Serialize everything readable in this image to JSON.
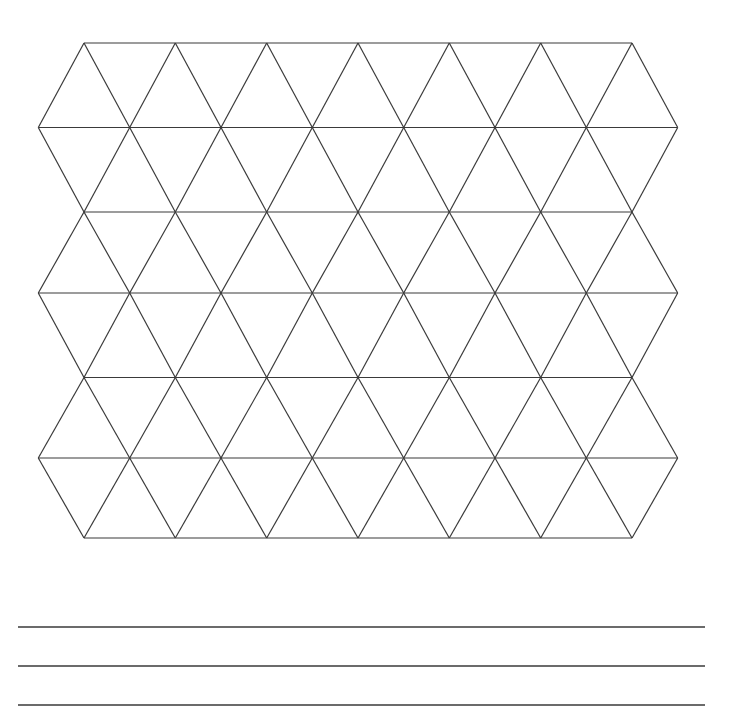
{
  "page": {
    "width": 734,
    "height": 709,
    "background_color": "#ffffff"
  },
  "figure": {
    "name": "triangular-tessellation-grid",
    "stroke_color": "#3a3a3a",
    "stroke_width": 1.2,
    "fill": "none",
    "rows_of_triangles": 6,
    "triangle_columns": 7,
    "total_triangles": 90,
    "bounds": {
      "left": 38,
      "top": 43,
      "right": 678,
      "bottom": 538
    }
  },
  "chart_data": {
    "type": "diagram",
    "title": "",
    "subtitle": "",
    "xlabel": "",
    "ylabel": "",
    "grid": true,
    "legend": "none",
    "lattice": {
      "kind": "triangular",
      "apex_x": [
        84,
        175.3,
        266.7,
        358,
        449.3,
        540.7,
        632
      ],
      "mid_x": [
        38.3,
        129.7,
        221,
        312.3,
        403.7,
        495,
        586.3,
        677.7
      ],
      "row_y": [
        43,
        127.5,
        212,
        293,
        377.5,
        458,
        538
      ],
      "full_width_rows_y": [
        127.5,
        293,
        458
      ],
      "short_rows_y": [
        43,
        212,
        377.5,
        538
      ],
      "column_spacing": 91.3,
      "row_spacing": 82.5
    }
  },
  "ruled_lines": {
    "name": "answer-rule-lines",
    "count": 3,
    "stroke_color": "#3a3a3a",
    "stroke_width": 1.6,
    "x_start": 18,
    "x_end": 705,
    "y_positions": [
      627,
      666,
      705
    ]
  }
}
